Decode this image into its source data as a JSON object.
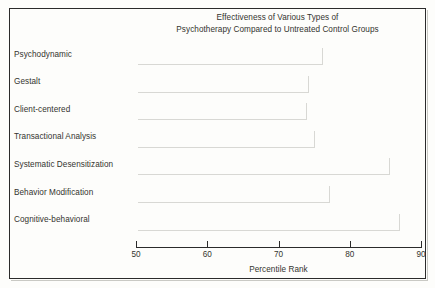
{
  "chart_data": {
    "type": "bar",
    "orientation": "horizontal",
    "title": "Effectiveness of Various Types of Psychotherapy Compared to Untreated Control Groups",
    "title_lines": [
      "Effectiveness of Various Types of",
      "Psychotherapy Compared to Untreated Control Groups"
    ],
    "categories": [
      "Psychodynamic",
      "Gestalt",
      "Client-centered",
      "Transactional Analysis",
      "Systematic Desensitization",
      "Behavior Modification",
      "Cognitive-behavioral"
    ],
    "values": [
      76,
      74,
      73.7,
      74.9,
      85.4,
      77,
      86.8
    ],
    "xlabel": "Percentile Rank",
    "ylabel": "",
    "xlim": [
      50,
      90
    ],
    "xticks": [
      50,
      60,
      70,
      80,
      90
    ],
    "xtick_labels": [
      "50",
      "60",
      "70",
      "80",
      "90"
    ],
    "grid": false,
    "legend": false,
    "bar_color": "#63635f",
    "background_color": "#fdfdfb",
    "border_color": "#2b2b2b",
    "text_color": "#34342f"
  }
}
